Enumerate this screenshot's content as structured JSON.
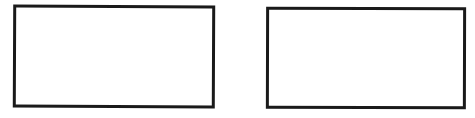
{
  "diagram": {
    "background_color": "#ffffff",
    "stroke_color": "#1a1a1a",
    "boxes": [
      {
        "id": "left",
        "label": ""
      },
      {
        "id": "right",
        "label": ""
      }
    ]
  }
}
